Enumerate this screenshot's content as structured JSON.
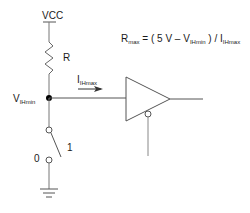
{
  "diagram": {
    "supply_label": "VCC",
    "resistor_label": "R",
    "node_label": {
      "main": "V",
      "sub": "IHmin"
    },
    "current_label": {
      "main": "I",
      "sub": "IHmax"
    },
    "switch_labels": {
      "closed": "1",
      "open": "0"
    },
    "formula": {
      "lhs_main": "R",
      "lhs_sub": "max",
      "eq": " = ( 5 V – ",
      "v_main": "V",
      "v_sub": "IHmin",
      "mid": " ) / ",
      "i_main": "I",
      "i_sub": "IHmax"
    },
    "components": [
      "vcc-supply",
      "pull-up-resistor",
      "node",
      "current-arrow",
      "tri-state-buffer",
      "enable-input",
      "switch",
      "ground"
    ],
    "colors": {
      "line": "#555555",
      "text": "#1a1a1a",
      "node": "#000000"
    }
  }
}
